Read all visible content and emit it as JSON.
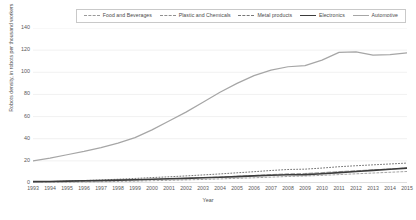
{
  "chart_data": {
    "type": "line",
    "title": "",
    "xlabel": "Year",
    "ylabel": "Robots density, in robots per thousand workers",
    "xlim": [
      1993,
      2015
    ],
    "ylim": [
      0,
      140
    ],
    "ytick_step": 20,
    "grid": true,
    "grid_axis": "y",
    "legend_position": "top",
    "legend_border": true,
    "x": [
      1993,
      1994,
      1995,
      1996,
      1997,
      1998,
      1999,
      2000,
      2001,
      2002,
      2003,
      2004,
      2005,
      2006,
      2007,
      2008,
      2009,
      2010,
      2011,
      2012,
      2013,
      2014,
      2015
    ],
    "categories": [
      "1993",
      "1994",
      "1995",
      "1996",
      "1997",
      "1998",
      "1999",
      "2000",
      "2001",
      "2002",
      "2003",
      "2004",
      "2005",
      "2006",
      "2007",
      "2008",
      "2009",
      "2010",
      "2011",
      "2012",
      "2013",
      "2014",
      "2015"
    ],
    "series": [
      {
        "name": "Food and Beverages",
        "color": "#9a9a9a",
        "dash": "2,2",
        "width": 0.9,
        "values": [
          0.4,
          0.5,
          0.7,
          0.9,
          1.1,
          1.4,
          1.7,
          2.1,
          2.4,
          2.8,
          3.2,
          3.7,
          4.2,
          4.7,
          5.3,
          5.9,
          6.3,
          6.9,
          7.6,
          8.3,
          9.0,
          9.7,
          10.4
        ]
      },
      {
        "name": "Plastic and Chemicals",
        "color": "#8f8f8f",
        "dash": "4,2",
        "width": 0.9,
        "values": [
          0.6,
          0.8,
          1.1,
          1.4,
          1.8,
          2.2,
          2.7,
          3.2,
          3.7,
          4.2,
          4.8,
          5.4,
          6.1,
          6.8,
          7.6,
          8.3,
          8.6,
          9.4,
          10.3,
          11.1,
          11.9,
          12.7,
          13.5
        ]
      },
      {
        "name": "Metal products",
        "color": "#777777",
        "dash": "1,2",
        "width": 1.0,
        "values": [
          1.0,
          1.3,
          1.7,
          2.2,
          2.8,
          3.4,
          4.1,
          4.9,
          5.6,
          6.4,
          7.3,
          8.2,
          9.2,
          10.2,
          11.3,
          12.2,
          12.5,
          13.5,
          14.7,
          15.6,
          16.4,
          17.2,
          18.0
        ]
      },
      {
        "name": "Electronics",
        "color": "#3b3b3b",
        "dash": "",
        "width": 1.6,
        "values": [
          1.2,
          1.4,
          1.7,
          2.0,
          2.3,
          2.6,
          3.0,
          3.4,
          3.8,
          4.2,
          4.7,
          5.2,
          5.8,
          6.4,
          7.0,
          7.5,
          7.6,
          8.4,
          9.4,
          10.4,
          11.4,
          12.4,
          13.4
        ]
      },
      {
        "name": "Automotive",
        "color": "#a6a6a6",
        "dash": "",
        "width": 1.2,
        "values": [
          20.0,
          22.5,
          25.5,
          28.5,
          32.0,
          36.0,
          41.0,
          48.0,
          56.0,
          64.0,
          73.0,
          82.0,
          90.0,
          97.0,
          102.0,
          105.0,
          106.0,
          111.0,
          118.0,
          118.5,
          115.5,
          116.0,
          117.5
        ]
      }
    ]
  },
  "axes": {
    "y_ticks": [
      "0",
      "20",
      "40",
      "60",
      "80",
      "100",
      "120",
      "140"
    ],
    "y_title": "Robots density, in robots per thousand workers",
    "x_title": "Year"
  },
  "legend": {
    "items": [
      {
        "label": "Food and Beverages"
      },
      {
        "label": "Plastic and Chemicals"
      },
      {
        "label": "Metal products"
      },
      {
        "label": "Electronics"
      },
      {
        "label": "Automotive"
      }
    ]
  }
}
